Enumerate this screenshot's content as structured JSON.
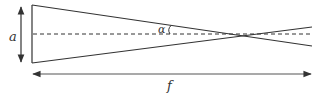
{
  "diagram": {
    "labels": {
      "aperture": "a",
      "angle": "α",
      "focal_length": "f"
    },
    "colors": {
      "line": "#333333",
      "background": "#ffffff"
    },
    "elements": [
      "aperture-edge",
      "upper-ray",
      "lower-ray",
      "optical-axis-dashed",
      "aperture-dimension-arrow",
      "focal-length-dimension-arrow",
      "angle-arc"
    ]
  }
}
